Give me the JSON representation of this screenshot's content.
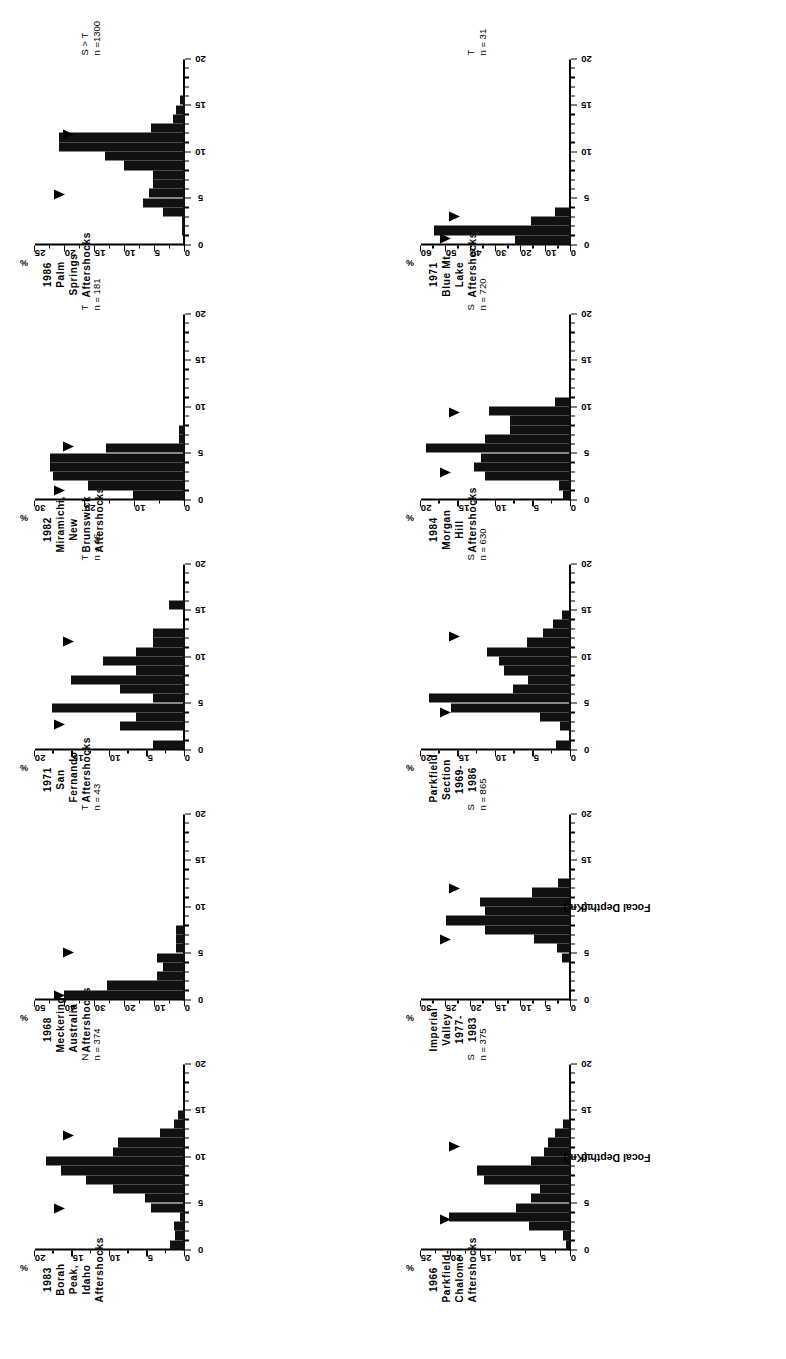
{
  "figure": {
    "xlabel": "Focal Depth (Km)",
    "y_unit": "%",
    "xticks": [
      0,
      5,
      10,
      15,
      20
    ],
    "xlim": [
      0,
      20
    ]
  },
  "chart_data": [
    {
      "type": "bar",
      "panel": 1,
      "title": "1986  Palm Springs\nAftershocks",
      "title_lines": [
        "1986  Palm Springs",
        "Aftershocks"
      ],
      "regime": "S > T",
      "n_label": "n =1300",
      "n": 1300,
      "ylabel": "%",
      "ylim": [
        0,
        25
      ],
      "yticks": [
        0,
        5,
        10,
        15,
        20,
        25
      ],
      "xlabel": "",
      "xlim": [
        0,
        20
      ],
      "xticks": [
        0,
        5,
        10,
        15,
        20
      ],
      "bin_width": 1,
      "x": [
        1,
        2,
        3,
        4,
        5,
        6,
        7,
        8,
        9,
        10,
        11,
        12,
        13,
        14,
        15
      ],
      "values": [
        0.5,
        0.5,
        3.7,
        7.0,
        6.0,
        5.3,
        5.3,
        10.2,
        13.4,
        21.0,
        21.0,
        5.7,
        2.0,
        1.5,
        0.8
      ],
      "arrows": [
        5.4,
        11.8
      ]
    },
    {
      "type": "bar",
      "panel": 2,
      "title": "1982\nMiramichi, New Brunswick\nAftershocks",
      "title_lines": [
        "1982",
        "Miramichi, New Brunswick",
        "Aftershocks"
      ],
      "regime": "T",
      "n_label": "n = 181",
      "n": 181,
      "ylabel": "%",
      "ylim": [
        0,
        30
      ],
      "yticks": [
        0,
        10,
        20,
        30
      ],
      "xlabel": "",
      "xlim": [
        0,
        20
      ],
      "xticks": [
        0,
        5,
        10,
        15,
        20
      ],
      "bin_width": 1,
      "x": [
        0,
        1,
        2,
        3,
        4,
        5,
        6,
        7
      ],
      "values": [
        10.5,
        19.5,
        26.5,
        27.0,
        27.0,
        15.8,
        1.3,
        1.3
      ],
      "arrows": [
        1.0,
        5.7
      ]
    },
    {
      "type": "bar",
      "panel": 3,
      "title": "1971  San Fernando\nAftershocks",
      "title_lines": [
        "1971  San Fernando",
        "Aftershocks"
      ],
      "regime": "T",
      "n_label": "n = 46",
      "n": 46,
      "ylabel": "%",
      "ylim": [
        0,
        20
      ],
      "yticks": [
        0,
        5,
        10,
        15,
        20
      ],
      "xlabel": "",
      "xlim": [
        0,
        20
      ],
      "xticks": [
        0,
        5,
        10,
        15,
        20
      ],
      "bin_width": 1,
      "x": [
        0,
        1,
        2,
        3,
        4,
        5,
        6,
        7,
        8,
        9,
        10,
        11,
        12,
        13,
        14,
        15
      ],
      "values": [
        4.3,
        0,
        8.7,
        6.5,
        17.8,
        4.3,
        8.7,
        15.2,
        6.5,
        10.9,
        6.5,
        4.3,
        4.3,
        0,
        0,
        2.2
      ],
      "arrows": [
        2.7,
        11.6
      ]
    },
    {
      "type": "bar",
      "panel": 4,
      "title": "1968  Meckering, Australia\nAftershocks",
      "title_lines": [
        "1968  Meckering, Australia",
        "Aftershocks"
      ],
      "regime": "T",
      "n_label": "n = 43",
      "n": 43,
      "ylabel": "%",
      "ylim": [
        0,
        50
      ],
      "yticks": [
        0,
        10,
        20,
        30,
        40,
        50
      ],
      "xlabel": "",
      "xlim": [
        0,
        20
      ],
      "xticks": [
        0,
        5,
        10,
        15,
        20
      ],
      "bin_width": 1,
      "x": [
        0,
        1,
        2,
        3,
        4,
        5,
        6,
        7
      ],
      "values": [
        40.2,
        26.0,
        9.5,
        7.2,
        9.5,
        2.9,
        2.9,
        2.9
      ],
      "arrows": [
        0.4,
        5.0
      ]
    },
    {
      "type": "bar",
      "panel": 5,
      "title": "1983  Borah Peak, Idaho\nAftershocks",
      "title_lines": [
        "1983  Borah Peak, Idaho",
        "Aftershocks"
      ],
      "regime": "N",
      "n_label": "n = 374",
      "n": 374,
      "ylabel": "%",
      "ylim": [
        0,
        20
      ],
      "yticks": [
        0,
        5,
        10,
        15,
        20
      ],
      "xlabel": "",
      "xlim": [
        0,
        20
      ],
      "xticks": [
        0,
        5,
        10,
        15,
        20
      ],
      "bin_width": 1,
      "x": [
        0,
        1,
        2,
        3,
        4,
        5,
        6,
        7,
        8,
        9,
        10,
        11,
        12,
        13,
        14,
        15
      ],
      "values": [
        2.0,
        1.3,
        1.5,
        0.7,
        4.6,
        5.3,
        9.6,
        13.2,
        16.6,
        18.5,
        9.6,
        8.9,
        3.3,
        1.5,
        1.0,
        0.3
      ],
      "arrows": [
        4.4,
        12.3
      ]
    },
    {
      "type": "bar",
      "panel": 6,
      "title": "1971  Blue Mt. Lake\nAftershocks",
      "title_lines": [
        "1971  Blue Mt. Lake",
        "Aftershocks"
      ],
      "regime": "T",
      "n_label": "n = 31",
      "n": 31,
      "ylabel": "%",
      "ylim": [
        0,
        60
      ],
      "yticks": [
        0,
        10,
        20,
        30,
        40,
        50,
        60
      ],
      "xlabel": "",
      "xlim": [
        0,
        20
      ],
      "xticks": [
        0,
        5,
        10,
        15,
        20
      ],
      "bin_width": 1,
      "x": [
        0,
        1,
        2,
        3
      ],
      "values": [
        22.6,
        54.8,
        16.1,
        6.5
      ],
      "arrows": [
        0.6,
        3.0
      ]
    },
    {
      "type": "bar",
      "panel": 7,
      "title": "1984  Morgan Hill\nAftershocks",
      "title_lines": [
        "1984  Morgan Hill",
        "Aftershocks"
      ],
      "regime": "S",
      "n_label": "n = 720",
      "n": 720,
      "ylabel": "%",
      "ylim": [
        0,
        20
      ],
      "yticks": [
        0,
        5,
        10,
        15,
        20
      ],
      "xlabel": "",
      "xlim": [
        0,
        20
      ],
      "xticks": [
        0,
        5,
        10,
        15,
        20
      ],
      "bin_width": 1,
      "x": [
        0,
        1,
        2,
        3,
        4,
        5,
        6,
        7,
        8,
        9,
        10
      ],
      "values": [
        1.1,
        1.6,
        11.5,
        13.0,
        12.0,
        19.3,
        11.5,
        8.2,
        8.2,
        11.0,
        2.2
      ],
      "arrows": [
        2.9,
        9.4
      ]
    },
    {
      "type": "bar",
      "panel": 8,
      "title": "Parkfield  Section\n1969-1986",
      "title_lines": [
        "Parkfield  Section",
        "1969-1986"
      ],
      "regime": "S",
      "n_label": "n = 630",
      "n": 630,
      "ylabel": "%",
      "ylim": [
        0,
        20
      ],
      "yticks": [
        0,
        5,
        10,
        15,
        20
      ],
      "xlabel": "",
      "xlim": [
        0,
        20
      ],
      "xticks": [
        0,
        5,
        10,
        15,
        20
      ],
      "bin_width": 1,
      "x": [
        0,
        1,
        2,
        3,
        4,
        5,
        6,
        7,
        8,
        9,
        10,
        11,
        12,
        13,
        14,
        15,
        16
      ],
      "values": [
        2.0,
        0.1,
        1.5,
        4.2,
        16.0,
        19.0,
        7.8,
        5.7,
        8.9,
        9.6,
        11.2,
        5.9,
        3.8,
        2.4,
        1.2,
        0.3,
        0.2
      ],
      "arrows": [
        4.0,
        12.2
      ]
    },
    {
      "type": "bar",
      "panel": 9,
      "title": "Imperial  Valley\n1977-1983",
      "title_lines": [
        "Imperial  Valley",
        "1977-1983"
      ],
      "regime": "S",
      "n_label": "n = 865",
      "n": 865,
      "ylabel": "%",
      "ylim": [
        0,
        30
      ],
      "yticks": [
        0,
        5,
        10,
        15,
        20,
        25,
        30
      ],
      "xlabel": "Focal Depth (Km)",
      "xlim": [
        0,
        20
      ],
      "xticks": [
        0,
        5,
        10,
        15,
        20
      ],
      "bin_width": 1,
      "x": [
        4,
        5,
        6,
        7,
        8,
        9,
        10,
        11,
        12,
        13
      ],
      "values": [
        1.8,
        2.8,
        7.5,
        17.2,
        25.0,
        17.2,
        18.2,
        7.8,
        2.7,
        0.4
      ],
      "arrows": [
        6.5,
        11.9
      ]
    },
    {
      "type": "bar",
      "panel": 10,
      "title": "1966  Parkfield-Chalome\nAftershocks",
      "title_lines": [
        "1966  Parkfield-Chalome",
        "Aftershocks"
      ],
      "regime": "S",
      "n_label": "n = 375",
      "n": 375,
      "ylabel": "%",
      "ylim": [
        0,
        25
      ],
      "yticks": [
        0,
        5,
        10,
        15,
        20,
        25
      ],
      "xlabel": "Focal Depth (Km)",
      "xlim": [
        0,
        20
      ],
      "xticks": [
        0,
        5,
        10,
        15,
        20
      ],
      "bin_width": 1,
      "x": [
        0,
        1,
        2,
        3,
        4,
        5,
        6,
        7,
        8,
        9,
        10,
        11,
        12,
        13,
        14
      ],
      "values": [
        0.8,
        1.3,
        7.0,
        20.3,
        9.2,
        6.6,
        5.2,
        14.5,
        15.7,
        6.6,
        4.5,
        3.8,
        2.7,
        1.3,
        0.3
      ],
      "arrows": [
        3.2,
        11.1
      ]
    }
  ]
}
